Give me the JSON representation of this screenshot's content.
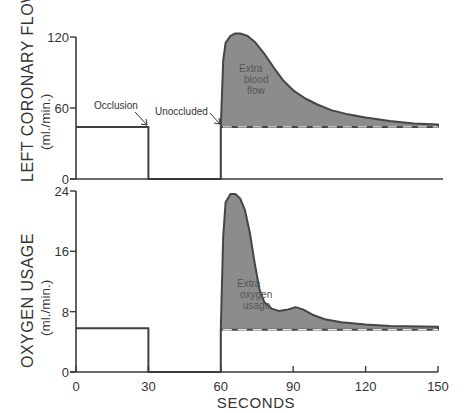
{
  "chart_data": [
    {
      "type": "area",
      "panel": "top",
      "ylabel": "LEFT CORONARY FLOW",
      "yunit": "(ml./min.)",
      "ylim": [
        0,
        120
      ],
      "yticks": [
        0,
        60,
        120
      ],
      "xlim": [
        0,
        150
      ],
      "baseline": 44,
      "series": [
        {
          "name": "Left coronary flow",
          "points": [
            [
              0,
              44
            ],
            [
              30,
              44
            ],
            [
              30,
              0
            ],
            [
              60,
              0
            ],
            [
              60,
              44
            ],
            [
              61,
              100
            ],
            [
              62,
              115
            ],
            [
              64,
              121
            ],
            [
              66,
              123
            ],
            [
              68,
              123
            ],
            [
              71,
              121
            ],
            [
              74,
              116
            ],
            [
              78,
              106
            ],
            [
              82,
              94
            ],
            [
              86,
              83
            ],
            [
              90,
              75
            ],
            [
              95,
              68
            ],
            [
              100,
              63
            ],
            [
              106,
              58
            ],
            [
              112,
              55
            ],
            [
              120,
              52
            ],
            [
              130,
              49
            ],
            [
              140,
              47
            ],
            [
              150,
              46
            ]
          ]
        }
      ],
      "annotations": [
        {
          "text": "Occlusion",
          "x": 30,
          "y": 44
        },
        {
          "text": "Unocluded",
          "x": 60,
          "y": 44
        },
        {
          "text": [
            "Extra",
            "blood",
            "flow"
          ]
        }
      ],
      "shaded_region": "Extra blood flow (between curve and baseline from 60 s)"
    },
    {
      "type": "area",
      "panel": "bottom",
      "ylabel": "OXYGEN USAGE",
      "yunit": "(ml./min.)",
      "ylim": [
        0,
        24
      ],
      "yticks": [
        0,
        8,
        16,
        24
      ],
      "xlim": [
        0,
        150
      ],
      "xticks": [
        0,
        30,
        60,
        90,
        120,
        150
      ],
      "xlabel": "SECONDS",
      "baseline": 5.6,
      "series": [
        {
          "name": "Oxygen usage",
          "points": [
            [
              0,
              5.8
            ],
            [
              30,
              5.8
            ],
            [
              30,
              0
            ],
            [
              60,
              0
            ],
            [
              60,
              5.6
            ],
            [
              61,
              18
            ],
            [
              62,
              22.5
            ],
            [
              64,
              23.6
            ],
            [
              66,
              23.6
            ],
            [
              68,
              23
            ],
            [
              70,
              21.5
            ],
            [
              72,
              18.5
            ],
            [
              74,
              14.5
            ],
            [
              76,
              11
            ],
            [
              78,
              9.3
            ],
            [
              81,
              8.4
            ],
            [
              84,
              8.1
            ],
            [
              88,
              8.3
            ],
            [
              91,
              8.6
            ],
            [
              94,
              8.3
            ],
            [
              98,
              7.6
            ],
            [
              103,
              7.0
            ],
            [
              110,
              6.6
            ],
            [
              120,
              6.3
            ],
            [
              130,
              6.1
            ],
            [
              150,
              6.0
            ]
          ]
        }
      ],
      "annotations": [
        {
          "text": [
            "Extra",
            "oxygen",
            "usage"
          ]
        }
      ],
      "shaded_region": "Extra oxygen usage (between curve and baseline from 60 s)"
    }
  ],
  "labels": {
    "top_ylabel": "LEFT CORONARY FLOW",
    "top_yunit": "(ml./min.)",
    "bottom_ylabel": "OXYGEN USAGE",
    "bottom_yunit": "(ml./min.)",
    "xlabel": "SECONDS",
    "occlusion": "Occlusion",
    "unoccluded": "Unoccluded",
    "extra_blood": [
      "Extra",
      "blood",
      "flow"
    ],
    "extra_oxygen": [
      "Extra",
      "oxygen",
      "usage"
    ],
    "top_yticks": [
      "0",
      "60",
      "120"
    ],
    "bottom_yticks": [
      "0",
      "8",
      "16",
      "24"
    ],
    "xticks": [
      "0",
      "30",
      "60",
      "90",
      "120",
      "150"
    ]
  },
  "colors": {
    "shade": "#8c8c8c",
    "line": "#3f3f3f",
    "axis": "#3a3a3a"
  }
}
